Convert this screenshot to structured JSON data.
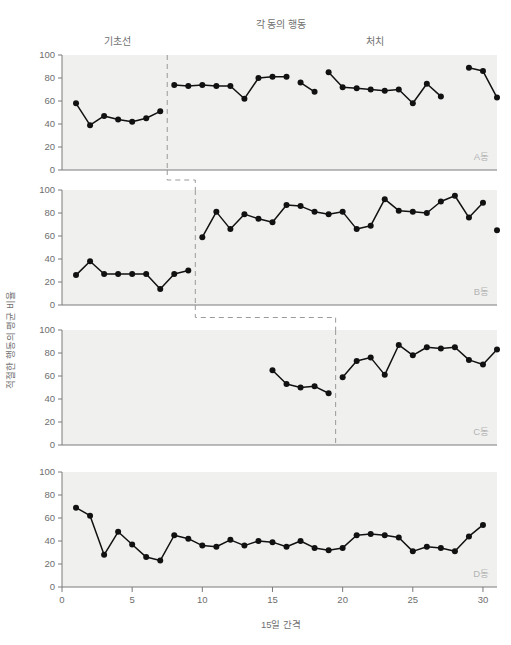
{
  "chart_data": {
    "type": "line",
    "title": "각 동의 행동",
    "xlabel": "15일 간격",
    "ylabel": "적절한 행동의 평균 비율",
    "phase_labels": {
      "baseline": "기초선",
      "treatment": "처치"
    },
    "xlim": [
      0,
      31
    ],
    "ylim": [
      0,
      100
    ],
    "x_ticks": [
      0,
      5,
      10,
      15,
      20,
      25,
      30
    ],
    "x_tick_labels": [
      "0",
      "5",
      "10",
      "15",
      "20",
      "25",
      "30"
    ],
    "y_ticks": [
      0,
      20,
      40,
      60,
      80,
      100
    ],
    "y_tick_labels": [
      "0",
      "20",
      "40",
      "60",
      "80",
      "100"
    ],
    "grid": false,
    "legend": "none",
    "marker": "filled-circle",
    "line_color": "#111111",
    "plot_bg_color": "#f0f0ef",
    "panels": [
      {
        "name": "A동",
        "phase_change_x": 7.5,
        "segments": [
          {
            "phase": "baseline",
            "x": [
              1,
              2,
              3,
              4,
              5,
              6,
              7
            ],
            "y": [
              58,
              39,
              47,
              44,
              42,
              45,
              51
            ]
          },
          {
            "phase": "treatment",
            "x": [
              8,
              9,
              10,
              11,
              12,
              13,
              14,
              15,
              16
            ],
            "y": [
              74,
              73,
              74,
              73,
              73,
              62,
              80,
              81,
              81
            ]
          },
          {
            "phase": "treatment",
            "x": [
              17,
              18
            ],
            "y": [
              76,
              68
            ]
          },
          {
            "phase": "treatment",
            "x": [
              19,
              20,
              21,
              22,
              23,
              24,
              25,
              26,
              27
            ],
            "y": [
              85,
              72,
              71,
              70,
              69,
              70,
              58,
              75,
              64
            ]
          },
          {
            "phase": "treatment",
            "x": [
              29,
              30,
              31
            ],
            "y": [
              89,
              86,
              63
            ]
          }
        ]
      },
      {
        "name": "B동",
        "phase_change_x": 9.5,
        "segments": [
          {
            "phase": "baseline",
            "x": [
              1,
              2,
              3,
              4,
              5,
              6,
              7,
              8,
              9
            ],
            "y": [
              26,
              38,
              27,
              27,
              27,
              27,
              14,
              27,
              30
            ]
          },
          {
            "phase": "treatment",
            "x": [
              10,
              11,
              12,
              13,
              14,
              15,
              16,
              17,
              18,
              19,
              20,
              21,
              22,
              23,
              24,
              25,
              26,
              27,
              28,
              29,
              30
            ],
            "y": [
              59,
              81,
              66,
              79,
              75,
              72,
              87,
              86,
              81,
              79,
              81,
              66,
              69,
              92,
              82,
              81,
              80,
              90,
              95,
              76,
              89
            ]
          },
          {
            "phase": "treatment",
            "x": [
              31
            ],
            "y": [
              65
            ]
          }
        ]
      },
      {
        "name": "C동",
        "phase_change_x": 19.5,
        "segments": [
          {
            "phase": "baseline",
            "x": [
              15,
              16,
              17,
              18,
              19
            ],
            "y": [
              65,
              53,
              50,
              51,
              45
            ]
          },
          {
            "phase": "treatment",
            "x": [
              20,
              21,
              22,
              23,
              24,
              25,
              26,
              27,
              28,
              29,
              30,
              31
            ],
            "y": [
              59,
              73,
              76,
              61,
              87,
              78,
              85,
              84,
              85,
              74,
              70,
              83
            ]
          }
        ]
      },
      {
        "name": "D동",
        "phase_change_x": null,
        "segments": [
          {
            "phase": "baseline",
            "x": [
              1,
              2,
              3,
              4,
              5,
              6,
              7,
              8,
              9,
              10,
              11,
              12,
              13,
              14,
              15,
              16,
              17,
              18,
              19,
              20,
              21,
              22,
              23,
              24,
              25,
              26,
              27,
              28,
              29,
              30
            ],
            "y": [
              69,
              62,
              28,
              48,
              37,
              26,
              23,
              45,
              42,
              36,
              35,
              41,
              36,
              40,
              39,
              35,
              40,
              34,
              32,
              34,
              45,
              46,
              45,
              43,
              31,
              35,
              34,
              31,
              44,
              54
            ]
          }
        ]
      }
    ],
    "staircase_connectors": [
      {
        "from_panel": 0,
        "to_panel": 1,
        "x_from": 7.5,
        "x_to": 9.5
      },
      {
        "from_panel": 1,
        "to_panel": 2,
        "x_from": 9.5,
        "x_to": 19.5
      }
    ]
  }
}
